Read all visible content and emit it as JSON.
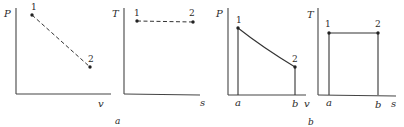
{
  "figure": {
    "groups": [
      {
        "caption": "a",
        "panels": [
          {
            "id": "a-pv",
            "y_label": "P",
            "x_label": "v",
            "points": [
              {
                "label": "1"
              },
              {
                "label": "2"
              }
            ],
            "path_style": "dashed"
          },
          {
            "id": "a-ts",
            "y_label": "T",
            "x_label": "s",
            "points": [
              {
                "label": "1"
              },
              {
                "label": "2"
              }
            ],
            "path_style": "dashed"
          }
        ]
      },
      {
        "caption": "b",
        "panels": [
          {
            "id": "b-pv",
            "y_label": "P",
            "x_label": "v",
            "points": [
              {
                "label": "1"
              },
              {
                "label": "2"
              }
            ],
            "path_style": "solid",
            "x_ticks": [
              "a",
              "b"
            ]
          },
          {
            "id": "b-ts",
            "y_label": "T",
            "x_label": "s",
            "points": [
              {
                "label": "1"
              },
              {
                "label": "2"
              }
            ],
            "path_style": "solid",
            "x_ticks": [
              "a",
              "b"
            ]
          }
        ]
      }
    ]
  }
}
